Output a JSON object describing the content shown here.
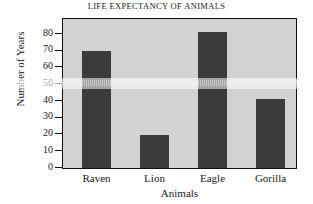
{
  "chart_data": {
    "type": "bar",
    "title": "LIFE EXPECTANCY OF ANIMALS",
    "xlabel": "Animals",
    "ylabel": "Number of Years",
    "categories": [
      "Raven",
      "Lion",
      "Eagle",
      "Gorilla"
    ],
    "values": [
      70,
      20,
      81,
      41
    ],
    "ylim": [
      0,
      89
    ],
    "yticks": [
      0,
      10,
      20,
      30,
      40,
      50,
      60,
      70,
      80
    ],
    "ytick_labels": [
      "0",
      "10",
      "20",
      "30",
      "40",
      "50",
      "60",
      "70",
      "80"
    ],
    "grid": false,
    "legend": null,
    "bar_color": "#3b3b3b",
    "plot_background": "#d2d2d2",
    "frame_color": "#111111"
  },
  "axes": {
    "y": {
      "ticks": [
        {
          "value": 80,
          "label": "80"
        },
        {
          "value": 70,
          "label": "70"
        },
        {
          "value": 60,
          "label": "60"
        },
        {
          "value": 50,
          "label": "50"
        },
        {
          "value": 40,
          "label": "40"
        },
        {
          "value": 30,
          "label": "30"
        },
        {
          "value": 20,
          "label": "20"
        },
        {
          "value": 10,
          "label": "10"
        },
        {
          "value": 0,
          "label": "0"
        }
      ]
    },
    "x": {
      "ticks": [
        {
          "label": "Raven"
        },
        {
          "label": "Lion"
        },
        {
          "label": "Eagle"
        },
        {
          "label": "Gorilla"
        }
      ]
    }
  },
  "bars": [
    {
      "label": "Raven",
      "value": 70
    },
    {
      "label": "Lion",
      "value": 20
    },
    {
      "label": "Eagle",
      "value": 81
    },
    {
      "label": "Gorilla",
      "value": 41
    }
  ]
}
